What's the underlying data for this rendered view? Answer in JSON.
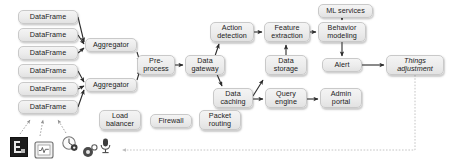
{
  "diagram": {
    "style": {
      "node_fill": "#ececec",
      "node_border": "#c9c9c9",
      "edge_color": "#2b2b2b",
      "dashed_edge_color": "#9a9a9a",
      "background": "#ffffff"
    },
    "nodes": [
      {
        "id": "df1",
        "label": "DataFrame",
        "x": 18,
        "y": 10,
        "w": 60,
        "h": 14
      },
      {
        "id": "df2",
        "label": "DataFrame",
        "x": 18,
        "y": 28,
        "w": 60,
        "h": 14
      },
      {
        "id": "df3",
        "label": "DataFrame",
        "x": 18,
        "y": 46,
        "w": 60,
        "h": 14
      },
      {
        "id": "df4",
        "label": "DataFrame",
        "x": 18,
        "y": 64,
        "w": 60,
        "h": 14
      },
      {
        "id": "df5",
        "label": "DataFrame",
        "x": 18,
        "y": 82,
        "w": 60,
        "h": 14
      },
      {
        "id": "df6",
        "label": "DataFrame",
        "x": 18,
        "y": 100,
        "w": 60,
        "h": 14
      },
      {
        "id": "agg1",
        "label": "Aggregator",
        "x": 85,
        "y": 38,
        "w": 52,
        "h": 14
      },
      {
        "id": "agg2",
        "label": "Aggregator",
        "x": 85,
        "y": 78,
        "w": 52,
        "h": 14
      },
      {
        "id": "prep",
        "label": "Pre-\nprocess",
        "x": 137,
        "y": 55,
        "w": 38,
        "h": 20
      },
      {
        "id": "gw",
        "label": "Data\ngateway",
        "x": 185,
        "y": 55,
        "w": 40,
        "h": 20
      },
      {
        "id": "act",
        "label": "Action\ndetection",
        "x": 210,
        "y": 22,
        "w": 44,
        "h": 20
      },
      {
        "id": "cache",
        "label": "Data\ncaching",
        "x": 213,
        "y": 88,
        "w": 40,
        "h": 20
      },
      {
        "id": "feat",
        "label": "Feature\nextraction",
        "x": 264,
        "y": 22,
        "w": 46,
        "h": 20
      },
      {
        "id": "store",
        "label": "Data\nstorage",
        "x": 265,
        "y": 55,
        "w": 42,
        "h": 20
      },
      {
        "id": "query",
        "label": "Query\nengine",
        "x": 265,
        "y": 88,
        "w": 42,
        "h": 20
      },
      {
        "id": "ml",
        "label": "ML services",
        "x": 318,
        "y": 4,
        "w": 55,
        "h": 14
      },
      {
        "id": "beh",
        "label": "Behavior\nmodeling",
        "x": 318,
        "y": 22,
        "w": 48,
        "h": 20
      },
      {
        "id": "alert",
        "label": "Alert",
        "x": 322,
        "y": 58,
        "w": 40,
        "h": 14
      },
      {
        "id": "admin",
        "label": "Admin\nportal",
        "x": 320,
        "y": 88,
        "w": 42,
        "h": 20
      },
      {
        "id": "thing",
        "label": "Things\nadjustment",
        "x": 386,
        "y": 55,
        "w": 58,
        "h": 20,
        "italic_first_line": true
      },
      {
        "id": "lb",
        "label": "Load\nbalancer",
        "x": 99,
        "y": 110,
        "w": 42,
        "h": 20
      },
      {
        "id": "fw",
        "label": "Firewall",
        "x": 150,
        "y": 114,
        "w": 42,
        "h": 14
      },
      {
        "id": "pkt",
        "label": "Packet\nrouting",
        "x": 199,
        "y": 110,
        "w": 42,
        "h": 20
      }
    ],
    "edges": [
      {
        "from": "df1",
        "to": "agg1",
        "type": "solid"
      },
      {
        "from": "df2",
        "to": "agg1",
        "type": "solid"
      },
      {
        "from": "df3",
        "to": "agg1",
        "type": "solid"
      },
      {
        "from": "df4",
        "to": "agg2",
        "type": "solid"
      },
      {
        "from": "df5",
        "to": "agg2",
        "type": "solid"
      },
      {
        "from": "df6",
        "to": "agg2",
        "type": "solid"
      },
      {
        "from": "agg1",
        "to": "prep",
        "type": "solid"
      },
      {
        "from": "agg2",
        "to": "prep",
        "type": "solid"
      },
      {
        "from": "prep",
        "to": "gw",
        "type": "solid"
      },
      {
        "from": "gw",
        "to": "act",
        "type": "solid"
      },
      {
        "from": "gw",
        "to": "cache",
        "type": "solid"
      },
      {
        "from": "act",
        "to": "feat",
        "type": "solid"
      },
      {
        "from": "store",
        "to": "feat",
        "type": "solid"
      },
      {
        "from": "cache",
        "to": "store",
        "type": "solid"
      },
      {
        "from": "cache",
        "to": "query",
        "type": "solid"
      },
      {
        "from": "feat",
        "to": "beh",
        "type": "solid"
      },
      {
        "from": "ml",
        "to": "beh",
        "type": "solid"
      },
      {
        "from": "beh",
        "to": "alert",
        "type": "solid"
      },
      {
        "from": "alert",
        "to": "thing",
        "type": "solid"
      },
      {
        "from": "query",
        "to": "admin",
        "type": "solid"
      },
      {
        "from": "sensor-thermostat",
        "to": "df6",
        "type": "dashed"
      },
      {
        "from": "sensor-gauge",
        "to": "df6",
        "type": "dashed"
      },
      {
        "from": "sensor-camera",
        "to": "df6",
        "type": "dashed"
      },
      {
        "from": "thing",
        "to": "sensor-feedback",
        "type": "dashed",
        "note": "feedback loop back to devices"
      }
    ],
    "icons": [
      {
        "id": "sensor-device",
        "name": "iot-device-icon",
        "x": 10,
        "y": 137
      },
      {
        "id": "sensor-thermostat",
        "name": "thermostat-icon",
        "x": 34,
        "y": 140
      },
      {
        "id": "sensor-gauge",
        "name": "gauge-sensor-icon",
        "x": 61,
        "y": 136
      },
      {
        "id": "sensor-camera",
        "name": "camera-sensor-icon",
        "x": 82,
        "y": 144
      },
      {
        "id": "sensor-mic",
        "name": "microphone-sensor-icon",
        "x": 99,
        "y": 139
      }
    ]
  }
}
